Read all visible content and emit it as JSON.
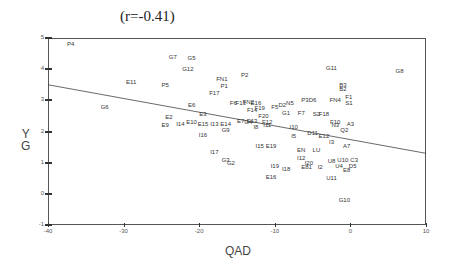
{
  "chart_data": {
    "type": "scatter",
    "title": "(r=-0.41)",
    "xlabel": "QAD",
    "ylabel": "Y G",
    "xlim": [
      -40,
      10
    ],
    "ylim": [
      -1,
      5
    ],
    "xticks": [
      -40,
      -30,
      -20,
      -10,
      0,
      10
    ],
    "yticks": [
      -1,
      0,
      1,
      2,
      3,
      4,
      5
    ],
    "grid": false,
    "legend": null,
    "regression_line": {
      "x": [
        -40,
        10
      ],
      "y": [
        3.5,
        1.3
      ]
    },
    "points": [
      {
        "label": "P4",
        "x": -37.0,
        "y": 4.8
      },
      {
        "label": "G7",
        "x": -23.5,
        "y": 4.4
      },
      {
        "label": "G5",
        "x": -21.0,
        "y": 4.35
      },
      {
        "label": "G12",
        "x": -21.5,
        "y": 4.0
      },
      {
        "label": "E11",
        "x": -29.0,
        "y": 3.6
      },
      {
        "label": "P5",
        "x": -24.5,
        "y": 3.5
      },
      {
        "label": "FN1",
        "x": -17.0,
        "y": 3.7
      },
      {
        "label": "P2",
        "x": -14.0,
        "y": 3.8
      },
      {
        "label": "P1",
        "x": -16.7,
        "y": 3.45
      },
      {
        "label": "F17",
        "x": -18.0,
        "y": 3.25
      },
      {
        "label": "G6",
        "x": -32.5,
        "y": 2.8
      },
      {
        "label": "E6",
        "x": -21.0,
        "y": 2.85
      },
      {
        "label": "E3",
        "x": -19.5,
        "y": 2.55
      },
      {
        "label": "E2",
        "x": -24.0,
        "y": 2.45
      },
      {
        "label": "E9",
        "x": -24.5,
        "y": 2.2
      },
      {
        "label": "I14",
        "x": -22.5,
        "y": 2.25
      },
      {
        "label": "E10",
        "x": -21.0,
        "y": 2.3
      },
      {
        "label": "E15",
        "x": -19.5,
        "y": 2.25
      },
      {
        "label": "I13",
        "x": -18.0,
        "y": 2.25
      },
      {
        "label": "E14",
        "x": -16.5,
        "y": 2.25
      },
      {
        "label": "G9",
        "x": -16.5,
        "y": 2.05
      },
      {
        "label": "I16",
        "x": -19.5,
        "y": 1.9
      },
      {
        "label": "I17",
        "x": -18.0,
        "y": 1.35
      },
      {
        "label": "G3",
        "x": -16.5,
        "y": 1.1
      },
      {
        "label": "G2",
        "x": -15.8,
        "y": 1.0
      },
      {
        "label": "F6",
        "x": -15.5,
        "y": 2.9
      },
      {
        "label": "F13",
        "x": -14.5,
        "y": 2.9
      },
      {
        "label": "FN2",
        "x": -13.5,
        "y": 2.95
      },
      {
        "label": "E16",
        "x": -12.5,
        "y": 2.9
      },
      {
        "label": "F14",
        "x": -13.0,
        "y": 2.7
      },
      {
        "label": "F19",
        "x": -12.0,
        "y": 2.75
      },
      {
        "label": "F5",
        "x": -10.0,
        "y": 2.8
      },
      {
        "label": "D2",
        "x": -9.0,
        "y": 2.85
      },
      {
        "label": "N5",
        "x": -8.0,
        "y": 2.9
      },
      {
        "label": "P3",
        "x": -6.0,
        "y": 3.0
      },
      {
        "label": "D6",
        "x": -5.0,
        "y": 3.0
      },
      {
        "label": "F20",
        "x": -11.5,
        "y": 2.5
      },
      {
        "label": "F12",
        "x": -11.0,
        "y": 2.3
      },
      {
        "label": "G1",
        "x": -8.5,
        "y": 2.6
      },
      {
        "label": "E7",
        "x": -14.5,
        "y": 2.35
      },
      {
        "label": "G4",
        "x": -13.5,
        "y": 2.3
      },
      {
        "label": "E13",
        "x": -13.0,
        "y": 2.35
      },
      {
        "label": "I8",
        "x": -12.5,
        "y": 2.15
      },
      {
        "label": "I11",
        "x": -11.0,
        "y": 2.2
      },
      {
        "label": "F7",
        "x": -6.5,
        "y": 2.6
      },
      {
        "label": "S2",
        "x": -4.5,
        "y": 2.55
      },
      {
        "label": "F18",
        "x": -3.5,
        "y": 2.55
      },
      {
        "label": "I10",
        "x": -7.5,
        "y": 2.15
      },
      {
        "label": "D11",
        "x": -5.0,
        "y": 1.95
      },
      {
        "label": "E12",
        "x": -3.5,
        "y": 1.85
      },
      {
        "label": "I5",
        "x": -7.5,
        "y": 1.85
      },
      {
        "label": "I3",
        "x": -2.5,
        "y": 1.65
      },
      {
        "label": "N3",
        "x": -2.0,
        "y": 2.2
      },
      {
        "label": "F10",
        "x": -2.0,
        "y": 2.3
      },
      {
        "label": "A3",
        "x": 0.0,
        "y": 2.25
      },
      {
        "label": "Q2",
        "x": -0.8,
        "y": 2.05
      },
      {
        "label": "A7",
        "x": -0.5,
        "y": 1.55
      },
      {
        "label": "B3",
        "x": -1.0,
        "y": 3.5
      },
      {
        "label": "B2",
        "x": -1.0,
        "y": 3.35
      },
      {
        "label": "FN4",
        "x": -2.0,
        "y": 3.0
      },
      {
        "label": "F1",
        "x": -0.2,
        "y": 3.1
      },
      {
        "label": "S1",
        "x": -0.2,
        "y": 2.9
      },
      {
        "label": "G11",
        "x": -2.5,
        "y": 4.05
      },
      {
        "label": "G8",
        "x": 6.5,
        "y": 3.95
      },
      {
        "label": "I15",
        "x": -12.0,
        "y": 1.55
      },
      {
        "label": "E19",
        "x": -10.5,
        "y": 1.55
      },
      {
        "label": "EN",
        "x": -6.5,
        "y": 1.4
      },
      {
        "label": "LU",
        "x": -4.5,
        "y": 1.4
      },
      {
        "label": "I12",
        "x": -6.5,
        "y": 1.15
      },
      {
        "label": "I20",
        "x": -5.5,
        "y": 1.0
      },
      {
        "label": "E81",
        "x": -5.8,
        "y": 0.85
      },
      {
        "label": "I2",
        "x": -4.0,
        "y": 0.85
      },
      {
        "label": "U8",
        "x": -2.5,
        "y": 1.05
      },
      {
        "label": "U10",
        "x": -1.0,
        "y": 1.1
      },
      {
        "label": "C3",
        "x": 0.5,
        "y": 1.1
      },
      {
        "label": "U4",
        "x": -1.5,
        "y": 0.9
      },
      {
        "label": "D5",
        "x": 0.3,
        "y": 0.9
      },
      {
        "label": "E8",
        "x": -0.5,
        "y": 0.75
      },
      {
        "label": "U11",
        "x": -2.5,
        "y": 0.5
      },
      {
        "label": "I19",
        "x": -10.0,
        "y": 0.9
      },
      {
        "label": "I18",
        "x": -8.5,
        "y": 0.8
      },
      {
        "label": "E16b",
        "x": -10.5,
        "y": 0.55
      },
      {
        "label": "G10",
        "x": -0.8,
        "y": -0.2
      }
    ]
  }
}
